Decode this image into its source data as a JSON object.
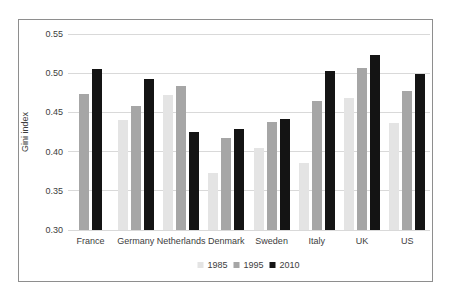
{
  "chart_data": {
    "type": "bar",
    "title": "",
    "xlabel": "",
    "ylabel": "Gini index",
    "categories": [
      "France",
      "Germany",
      "Netherlands",
      "Denmark",
      "Sweden",
      "Italy",
      "UK",
      "US"
    ],
    "series": [
      {
        "name": "1985",
        "color": "#e4e4e4",
        "values": [
          null,
          0.44,
          0.472,
          0.373,
          0.404,
          0.386,
          0.469,
          0.436
        ]
      },
      {
        "name": "1995",
        "color": "#a6a6a6",
        "values": [
          0.473,
          0.458,
          0.484,
          0.417,
          0.438,
          0.465,
          0.506,
          0.477
        ]
      },
      {
        "name": "2010",
        "color": "#141414",
        "values": [
          0.505,
          0.492,
          0.425,
          0.429,
          0.441,
          0.503,
          0.523,
          0.499
        ]
      }
    ],
    "ylim": [
      0.3,
      0.55
    ],
    "yticks": [
      0.3,
      0.35,
      0.4,
      0.45,
      0.5,
      0.55
    ],
    "ytick_format_decimals": 2,
    "grid": true,
    "legend_position": "bottom",
    "colors": {
      "gridline": "#d9d9d9",
      "frame_border": "#8e8e8e",
      "text": "#3d3d3d",
      "background": "#ffffff"
    }
  }
}
